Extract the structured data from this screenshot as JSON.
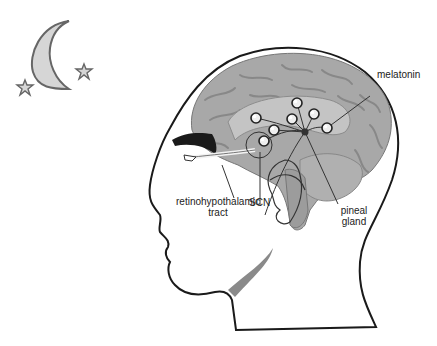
{
  "labels": {
    "melatonin": "melatonin",
    "rht_line1": "retinohypothalamic",
    "rht_line2": "tract",
    "scn": "SCN",
    "pineal_line1": "pineal",
    "pineal_line2": "gland"
  },
  "icons": {
    "moon": "crescent-moon",
    "stars": [
      "star",
      "star"
    ],
    "neurons": 7
  },
  "colors": {
    "outline": "#1a1a1a",
    "brain": "#a8a8a8",
    "brain_dark": "#8c8c8c",
    "brain_light": "#c4c4c4",
    "moon_fill": "#d6d6d6",
    "moon_stroke": "#666666",
    "background": "#ffffff"
  }
}
